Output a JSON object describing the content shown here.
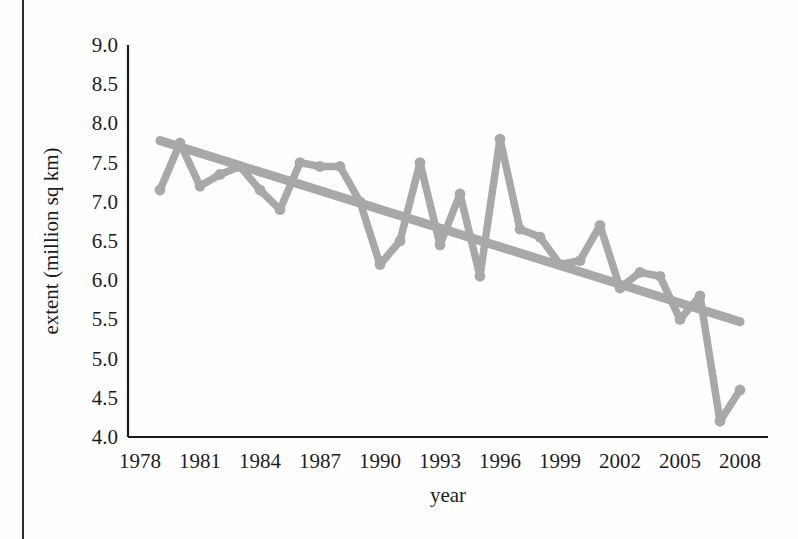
{
  "figure": {
    "background_color": "#fefefe",
    "page_edge_color": "#2b2b2b",
    "axis_color": "#1d1d1d",
    "series_color": "#a8a8a8",
    "trend_color": "#a8a8a8"
  },
  "chart_data": {
    "type": "line",
    "title": "",
    "subtitle": "",
    "xlabel": "year",
    "ylabel": "extent (million sq km)",
    "xlim": [
      1978,
      2008.5
    ],
    "ylim": [
      4.0,
      9.0
    ],
    "grid": false,
    "legend": null,
    "xticks": [
      1978,
      1981,
      1984,
      1987,
      1990,
      1993,
      1996,
      1999,
      2002,
      2005,
      2008
    ],
    "xtick_labels": [
      "1978",
      "1981",
      "1984",
      "1987",
      "1990",
      "1993",
      "1996",
      "1999",
      "2002",
      "2005",
      "2008"
    ],
    "yticks": [
      4.0,
      4.5,
      5.0,
      5.5,
      6.0,
      6.5,
      7.0,
      7.5,
      8.0,
      8.5,
      9.0
    ],
    "ytick_labels": [
      "4.0",
      "4.5",
      "5.0",
      "5.5",
      "6.0",
      "6.5",
      "7.0",
      "7.5",
      "8.0",
      "8.5",
      "9.0"
    ],
    "x": [
      1979,
      1980,
      1981,
      1982,
      1983,
      1984,
      1985,
      1986,
      1987,
      1988,
      1989,
      1990,
      1991,
      1992,
      1993,
      1994,
      1995,
      1996,
      1997,
      1998,
      1999,
      2000,
      2001,
      2002,
      2003,
      2004,
      2005,
      2006,
      2007,
      2008
    ],
    "series": [
      {
        "name": "extent",
        "marker": "circle",
        "values": [
          7.15,
          7.75,
          7.2,
          7.35,
          7.45,
          7.15,
          6.9,
          7.5,
          7.45,
          7.45,
          7.0,
          6.2,
          6.5,
          7.5,
          6.45,
          7.1,
          6.05,
          7.8,
          6.65,
          6.55,
          6.2,
          6.25,
          6.7,
          5.9,
          6.1,
          6.05,
          5.5,
          5.8,
          4.2,
          4.6
        ]
      }
    ],
    "trendline": {
      "name": "linear trend",
      "x": [
        1979,
        2008
      ],
      "y": [
        7.78,
        5.47
      ]
    }
  }
}
